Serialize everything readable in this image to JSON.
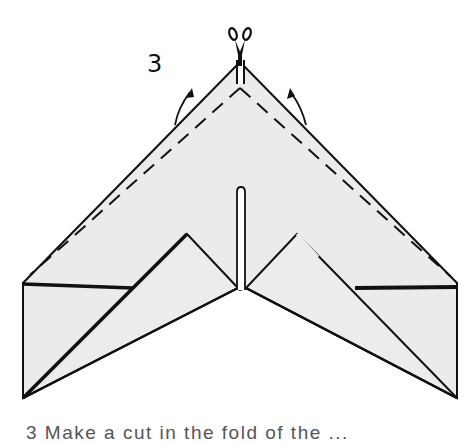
{
  "figure": {
    "step_number": "3",
    "caption": "3  Make a cut in the fold of the ...",
    "colors": {
      "paper_fill": "#ebebeb",
      "line": "#111111",
      "background": "#ffffff"
    },
    "icons": [
      "scissors-icon",
      "fold-arrow-left-icon",
      "fold-arrow-right-icon"
    ],
    "elements": {
      "outline": "paper-outline",
      "dashed_fold_lines": [
        "left",
        "right"
      ],
      "center_slit": "cut-slit",
      "inner_flaps": [
        "left",
        "right"
      ]
    }
  }
}
